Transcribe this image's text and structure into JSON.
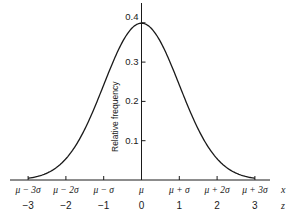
{
  "chart_data": {
    "type": "line",
    "title": "",
    "xlabel": "x",
    "zlabel": "z",
    "ylabel": "Relative frequency",
    "ylim": [
      0,
      0.4
    ],
    "xlim_z": [
      -3,
      3
    ],
    "y_ticks": [
      0.1,
      0.2,
      0.3,
      0.4
    ],
    "y_tick_labels": [
      "0.1",
      "0.2",
      "0.3",
      "0.4"
    ],
    "x_ticks_z": [
      -3,
      -2,
      -1,
      0,
      1,
      2,
      3
    ],
    "x_tick_labels": [
      "μ − 3σ",
      "μ − 2σ",
      "μ − σ",
      "μ",
      "μ + σ",
      "μ + 2σ",
      "μ + 3σ"
    ],
    "z_tick_labels": [
      "−3",
      "−2",
      "−1",
      "0",
      "1",
      "2",
      "3"
    ],
    "series": [
      {
        "name": "Normal density",
        "x": [
          -3,
          -2.5,
          -2,
          -1.5,
          -1,
          -0.5,
          0,
          0.5,
          1,
          1.5,
          2,
          2.5,
          3
        ],
        "values": [
          0.0044,
          0.0175,
          0.054,
          0.1295,
          0.242,
          0.3521,
          0.3989,
          0.3521,
          0.242,
          0.1295,
          0.054,
          0.0175,
          0.0044
        ]
      }
    ],
    "grid": false,
    "legend": "none"
  },
  "colors": {
    "line": "#1a1a1a",
    "background": "#ffffff"
  }
}
